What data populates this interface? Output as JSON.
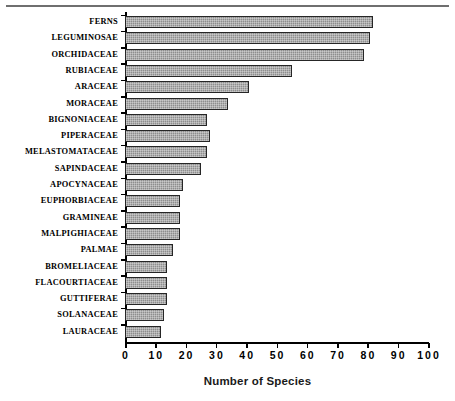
{
  "chart_data": {
    "type": "bar",
    "orientation": "horizontal",
    "title": "",
    "xlabel": "Number of Species",
    "ylabel": "",
    "xlim": [
      0,
      100
    ],
    "xticks": [
      0,
      10,
      20,
      30,
      40,
      50,
      60,
      70,
      80,
      90,
      100
    ],
    "xtick_labels": [
      "0",
      "10",
      "20",
      "30",
      "40",
      "50",
      "60",
      "70",
      "80",
      "90",
      "100"
    ],
    "grid": false,
    "legend": null,
    "bar_fill_color": "#8e8e8e",
    "bar_edge_color": "#262626",
    "categories": [
      "FERNS",
      "LEGUMINOSAE",
      "ORCHIDACEAE",
      "RUBIACEAE",
      "ARACEAE",
      "MORACEAE",
      "BIGNONIACEAE",
      "PIPERACEAE",
      "MELASTOMATACEAE",
      "SAPINDACEAE",
      "APOCYNACEAE",
      "EUPHORBIACEAE",
      "GRAMINEAE",
      "MALPIGHIACEAE",
      "PALMAE",
      "BROMELIACEAE",
      "FLACOURTIACEAE",
      "GUTTIFERAE",
      "SOLANACEAE",
      "LAURACEAE"
    ],
    "values": [
      82,
      81,
      79,
      55,
      41,
      34,
      27,
      28,
      27,
      25,
      19,
      18,
      18,
      18,
      16,
      14,
      14,
      14,
      13,
      12
    ]
  }
}
